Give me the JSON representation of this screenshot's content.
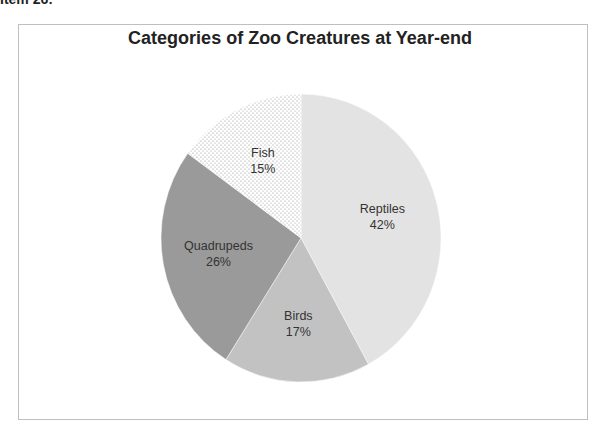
{
  "page": {
    "cropped_heading": "Item 26:"
  },
  "chart_data": {
    "type": "pie",
    "title": "Categories of Zoo Creatures at Year-end",
    "categories": [
      "Reptiles",
      "Birds",
      "Quadrupeds",
      "Fish"
    ],
    "values": [
      42,
      17,
      26,
      15
    ],
    "unit": "%",
    "labels": [
      "42%",
      "17%",
      "26%",
      "15%"
    ],
    "colors": [
      "#e3e3e3",
      "#c2c2c2",
      "#9a9a9a",
      "#ffffff"
    ],
    "patterns": [
      "solid",
      "solid",
      "solid",
      "dotted"
    ],
    "start_angle_deg": 0,
    "direction": "clockwise",
    "legend": "none",
    "data_labels": "inside, category name and percentage"
  }
}
